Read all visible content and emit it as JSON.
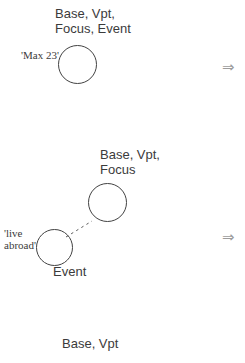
{
  "colors": {
    "background": "#ffffff",
    "text": "#3b3b3b",
    "circle_stroke": "#424242",
    "arrow": "#9c9c9c",
    "connector": "#5a5a5a"
  },
  "stage1": {
    "title": "Base, Vpt,\nFocus, Event",
    "circle_label": "'Max 23'"
  },
  "stage2": {
    "title": "Base, Vpt,\nFocus",
    "event_circle_label": "'live\nabroad'",
    "event_label": "Event"
  },
  "stage3": {
    "title": "Base, Vpt"
  },
  "icons": {
    "double_arrow_right": "⇒"
  }
}
